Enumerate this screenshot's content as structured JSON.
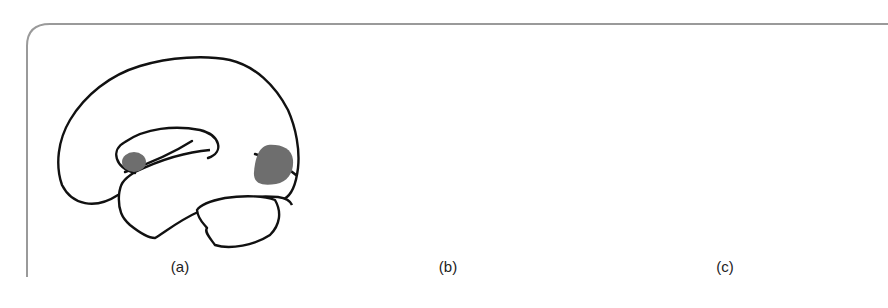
{
  "figure": {
    "panels": [
      {
        "id": "a",
        "label": "(a)",
        "description": "Lateral brain view with activation near anterior insula/orbitofrontal region and posterior occipito-temporal region"
      },
      {
        "id": "b",
        "label": "(b)",
        "description": "Lateral brain view with three activation clusters around the central/parietal region above the Sylvian fissure"
      },
      {
        "id": "c",
        "label": "(c)",
        "description": "Lateral brain view with large frontal activation, small parietal spot and cerebellar activation"
      }
    ],
    "colors": {
      "outline": "#111111",
      "activation": "#6e6e6e",
      "frame": "#9a9a9a",
      "background": "#ffffff"
    }
  }
}
